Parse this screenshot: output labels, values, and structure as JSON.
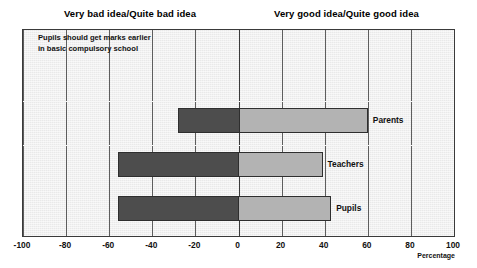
{
  "header": {
    "left_label": "Very bad idea/Quite bad idea",
    "right_label": "Very good idea/Quite good idea"
  },
  "question": "Pupils should get marks earlier\nin basic compulsory school",
  "axis": {
    "title": "Percentage",
    "ticks": [
      "-100",
      "-80",
      "-60",
      "-40",
      "-20",
      "0",
      "20",
      "40",
      "60",
      "80",
      "100"
    ]
  },
  "colors": {
    "negative_segment": "#4d4d4d",
    "positive_segment": "#b3b3b3",
    "plot_background": "#e9e9e9",
    "gridline": "#5d5d5d",
    "frame": "#3a3a3a"
  },
  "chart_data": {
    "type": "bar",
    "orientation": "horizontal",
    "stacked": "diverging",
    "title": "Pupils should get marks earlier in basic compulsory school",
    "xlabel": "Percentage",
    "ylabel": "",
    "xlim": [
      -100,
      100
    ],
    "xticks": [
      -100,
      -80,
      -60,
      -40,
      -20,
      0,
      20,
      40,
      60,
      80,
      100
    ],
    "grid": true,
    "legend": "none",
    "categories": [
      "Parents",
      "Teachers",
      "Pupils"
    ],
    "series": [
      {
        "name": "Very bad idea/Quite bad idea",
        "values": [
          -28,
          -56,
          -56
        ]
      },
      {
        "name": "Very good idea/Quite good idea",
        "values": [
          60,
          39,
          43
        ]
      }
    ],
    "bars": [
      {
        "category": "Parents",
        "negative": -28,
        "positive": 60
      },
      {
        "category": "Teachers",
        "negative": -56,
        "positive": 39
      },
      {
        "category": "Pupils",
        "negative": -56,
        "positive": 43
      }
    ]
  }
}
